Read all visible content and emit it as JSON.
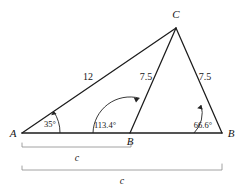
{
  "figure": {
    "kind": "triangle-diagram",
    "vertices": [
      {
        "id": "A",
        "label": "A",
        "x": 22,
        "y": 133
      },
      {
        "id": "B1",
        "label": "B",
        "x": 130,
        "y": 133
      },
      {
        "id": "B2",
        "label": "B",
        "x": 222,
        "y": 133
      },
      {
        "id": "C",
        "label": "C",
        "x": 176,
        "y": 28
      }
    ],
    "sides": [
      {
        "id": "AC",
        "label": "12",
        "from": "A",
        "to": "C",
        "label_x": 88,
        "label_y": 80
      },
      {
        "id": "B1C",
        "label": "7.5",
        "from": "B1",
        "to": "C",
        "label_x": 146,
        "label_y": 80
      },
      {
        "id": "B2C",
        "label": "7.5",
        "from": "B2",
        "to": "C",
        "label_x": 205,
        "label_y": 80
      }
    ],
    "angles": [
      {
        "id": "angle-A",
        "label": "35°",
        "at": "A",
        "label_x": 50,
        "label_y": 127
      },
      {
        "id": "angle-B1",
        "label": "113.4°",
        "at": "B1",
        "label_x": 101,
        "label_y": 128
      },
      {
        "id": "angle-B2",
        "label": "66.6°",
        "at": "B2",
        "label_x": 203,
        "label_y": 128
      }
    ],
    "braces": [
      {
        "id": "brace-short",
        "label": "c",
        "from_x": 22,
        "to_x": 131,
        "y": 147,
        "label_x": 77,
        "label_y": 160
      },
      {
        "id": "brace-long",
        "label": "c",
        "from_x": 22,
        "to_x": 222,
        "y": 170,
        "label_x": 122,
        "label_y": 183
      }
    ],
    "colors": {
      "stroke": "#1c1c1c",
      "arc": "#222222",
      "brace": "#8a8a8a",
      "text": "#161616",
      "background": "#ffffff"
    }
  }
}
